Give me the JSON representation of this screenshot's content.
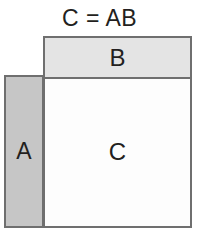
{
  "diagram": {
    "title": "C = AB",
    "background_color": "#ffffff",
    "border_color": "#6f6f6f",
    "text_color": "#231f20",
    "blocks": [
      {
        "id": "a",
        "label": "A",
        "role": "left-operand-matrix",
        "fill_color": "#c6c6c6",
        "x": 4,
        "y": 75,
        "width": 40,
        "height": 153
      },
      {
        "id": "b",
        "label": "B",
        "role": "right-operand-matrix",
        "fill_color": "#e4e4e4",
        "x": 43,
        "y": 36,
        "width": 149,
        "height": 43
      },
      {
        "id": "c",
        "label": "C",
        "role": "result-matrix",
        "fill_color": "#fdfdfd",
        "x": 43,
        "y": 76,
        "width": 149,
        "height": 152
      }
    ]
  }
}
